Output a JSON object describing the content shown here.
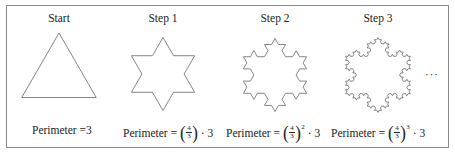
{
  "figure": {
    "stroke_color": "#777777",
    "border_color": "#8a8a8a",
    "steps": [
      {
        "label": "Start",
        "iterations": 0,
        "cx": 59,
        "cy": 76,
        "r": 43,
        "caption": {
          "prefix": "Perimeter = ",
          "base_num": "",
          "base_den": "",
          "exponent": "",
          "suffix": "3"
        }
      },
      {
        "label": "Step 1",
        "iterations": 1,
        "cx": 163,
        "cy": 74,
        "r": 42,
        "caption": {
          "prefix": "Perimeter = ",
          "base_num": "4",
          "base_den": "3",
          "exponent": "",
          "suffix": " · 3"
        }
      },
      {
        "label": "Step 2",
        "iterations": 2,
        "cx": 275,
        "cy": 75,
        "r": 42,
        "caption": {
          "prefix": "Perimeter = ",
          "base_num": "4",
          "base_den": "3",
          "exponent": "2",
          "suffix": " · 3"
        }
      },
      {
        "label": "Step 3",
        "iterations": 3,
        "cx": 378,
        "cy": 75,
        "r": 43,
        "caption": {
          "prefix": "Perimeter = ",
          "base_num": "4",
          "base_den": "3",
          "exponent": "3",
          "suffix": " · 3"
        }
      }
    ],
    "continuation": "···"
  }
}
